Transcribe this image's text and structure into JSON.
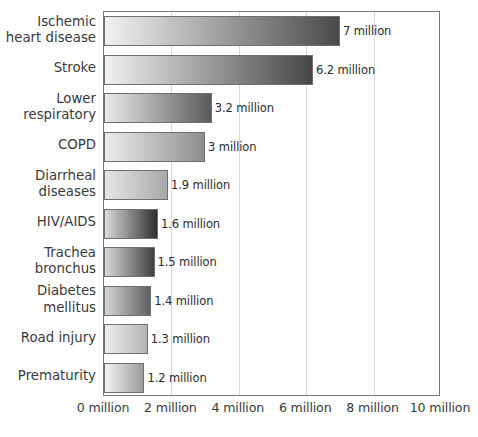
{
  "chart_data": {
    "type": "bar",
    "orientation": "horizontal",
    "title": "",
    "subtitle": "",
    "xlabel": "",
    "ylabel": "",
    "xlim": [
      0,
      10
    ],
    "ylim": null,
    "grid": true,
    "legend": null,
    "unit": "million",
    "categories": [
      "Ischemic\nheart disease",
      "Stroke",
      "Lower\nrespiratory",
      "COPD",
      "Diarrheal\ndiseases",
      "HIV/AIDS",
      "Trachea\nbronchus",
      "Diabetes\nmellitus",
      "Road injury",
      "Prematurity"
    ],
    "values": [
      7,
      6.2,
      3.2,
      3,
      1.9,
      1.6,
      1.5,
      1.4,
      1.3,
      1.2
    ],
    "value_labels": [
      "7 million",
      "6.2 million",
      "3.2 million",
      "3 million",
      "1.9 million",
      "1.6 million",
      "1.5 million",
      "1.4 million",
      "1.3 million",
      "1.2 million"
    ],
    "xticks": [
      0,
      2,
      4,
      6,
      8,
      10
    ],
    "xtick_labels": [
      "0 million",
      "2 million",
      "4 million",
      "6 million",
      "8 million",
      "10 million"
    ],
    "bar_gradients": [
      {
        "from": "#f2f2f2",
        "to": "#4a4a4c"
      },
      {
        "from": "#f0f0f0",
        "to": "#474749"
      },
      {
        "from": "#eaeaea",
        "to": "#595a5c"
      },
      {
        "from": "#ededed",
        "to": "#8e8e90"
      },
      {
        "from": "#e6e6e6",
        "to": "#a8a8aa"
      },
      {
        "from": "#dcdcdc",
        "to": "#2e2e30"
      },
      {
        "from": "#d8d8d8",
        "to": "#404042"
      },
      {
        "from": "#d5d5d5",
        "to": "#606062"
      },
      {
        "from": "#efefef",
        "to": "#b4b4b6"
      },
      {
        "from": "#f4f4f4",
        "to": "#9b9b9d"
      }
    ],
    "colors": {
      "axis": "#77777a",
      "grid": "#d9d9dd",
      "bar_edge": "#6f6f72",
      "text": "#3a3a3d",
      "value_text": "#2b2b2e",
      "background": "#ffffff"
    }
  }
}
